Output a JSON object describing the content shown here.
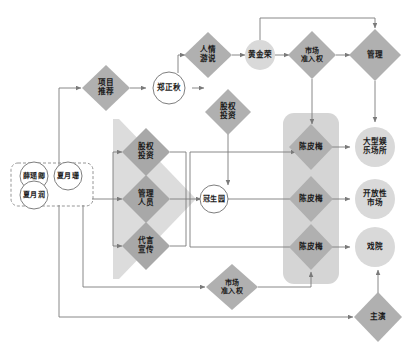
{
  "diagram": {
    "type": "flow-diagram",
    "title": "",
    "colors": {
      "diamond_fill": "#b0b0b0",
      "diamond_dark_fill": "#a8a8a8",
      "circle_fill": "#d9d9d9",
      "band_fill": "#d5d5d5",
      "band_left_fill": "#dcdcdc",
      "line": "#7a7a7a",
      "text": "#1b1b1b",
      "dashed_border": "#8a8a8a",
      "circle_stroke": "#6f6f6f"
    },
    "groups": [
      {
        "id": "actor-group",
        "shape": "dashed-rounded-rect",
        "label": ""
      },
      {
        "id": "left-band",
        "shape": "large-diamond-band",
        "label": ""
      },
      {
        "id": "right-band",
        "shape": "rounded-rect-band",
        "label": ""
      }
    ],
    "nodes": [
      {
        "id": "xue-yao-qing",
        "label": "薛瑶卿",
        "shape": "circle"
      },
      {
        "id": "xia-yue-shan",
        "label": "夏月珊",
        "shape": "circle"
      },
      {
        "id": "xia-yue-run",
        "label": "夏月润",
        "shape": "circle"
      },
      {
        "id": "xiang-mu-tui-jian",
        "label": "项目\n推荐",
        "shape": "diamond"
      },
      {
        "id": "zheng-zheng-qiu",
        "label": "郑正秋",
        "shape": "circle"
      },
      {
        "id": "ren-qing-you-shui",
        "label": "人情\n游说",
        "shape": "diamond"
      },
      {
        "id": "huang-jin-rong",
        "label": "黄金荣",
        "shape": "circle"
      },
      {
        "id": "shi-chang-zhun-ru-quan-top",
        "label": "市场\n准入权",
        "shape": "diamond"
      },
      {
        "id": "guan-li",
        "label": "管理",
        "shape": "diamond"
      },
      {
        "id": "gu-quan-tou-zi-top",
        "label": "股权\n投资",
        "shape": "diamond"
      },
      {
        "id": "gu-quan-tou-zi-band",
        "label": "股权\n投资",
        "shape": "diamond"
      },
      {
        "id": "guan-li-ren-yuan",
        "label": "管理\n人员",
        "shape": "diamond"
      },
      {
        "id": "dai-yan-xuan-chuan",
        "label": "代言\n宣传",
        "shape": "diamond"
      },
      {
        "id": "guan-sheng-yuan",
        "label": "冠生园",
        "shape": "circle"
      },
      {
        "id": "chen-pi-mei-1",
        "label": "陈皮梅",
        "shape": "diamond"
      },
      {
        "id": "chen-pi-mei-2",
        "label": "陈皮梅",
        "shape": "diamond"
      },
      {
        "id": "chen-pi-mei-3",
        "label": "陈皮梅",
        "shape": "diamond"
      },
      {
        "id": "da-xing-yu-le-chang-suo",
        "label": "大型娱\n乐场所",
        "shape": "circle"
      },
      {
        "id": "kai-fang-xing-shi-chang",
        "label": "开放性\n市场",
        "shape": "circle"
      },
      {
        "id": "xi-yuan",
        "label": "戏院",
        "shape": "circle"
      },
      {
        "id": "shi-chang-zhun-ru-quan-bottom",
        "label": "市场\n准入权",
        "shape": "diamond"
      },
      {
        "id": "zhu-yan",
        "label": "主演",
        "shape": "diamond"
      }
    ]
  }
}
